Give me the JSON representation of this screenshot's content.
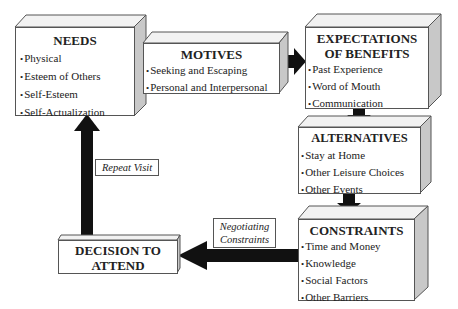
{
  "boxes": {
    "needs": {
      "title": "NEEDS",
      "items": [
        "Physical",
        "Esteem of Others",
        "Self-Esteem",
        "Self-Actualization"
      ]
    },
    "motives": {
      "title": "MOTIVES",
      "items": [
        "Seeking and Escaping",
        "Personal and Interpersonal"
      ]
    },
    "expectations": {
      "title_line1": "EXPECTATIONS",
      "title_line2": "OF BENEFITS",
      "items": [
        "Past Experience",
        "Word of Mouth",
        "Communication"
      ]
    },
    "alternatives": {
      "title": "ALTERNATIVES",
      "items": [
        "Stay at Home",
        "Other Leisure Choices",
        "Other Events"
      ]
    },
    "constraints": {
      "title": "CONSTRAINTS",
      "items": [
        "Time and Money",
        "Knowledge",
        "Social Factors",
        "Other Barriers"
      ]
    },
    "decision": {
      "title_line1": "DECISION TO",
      "title_line2": "ATTEND"
    }
  },
  "labels": {
    "repeat_visit": "Repeat Visit",
    "negotiating_line1": "Negotiating",
    "negotiating_line2": "Constraints"
  },
  "colors": {
    "arrow": "#111111",
    "border": "#555555",
    "side_face": "#c8c8c8"
  }
}
